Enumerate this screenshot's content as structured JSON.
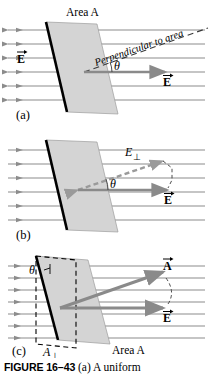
{
  "figure": {
    "number": "FIGURE 16–43",
    "caption_text": "(a) A uniform",
    "area_label_a": "Area A",
    "area_label_c": "Area A",
    "perpendicular_label": "Perpendicular to area"
  },
  "panels": [
    {
      "id": "a",
      "panel_label": "(a)",
      "labels": {
        "field_left": "E",
        "field_right": "E",
        "theta": "θ",
        "area": "Area A",
        "perpendicular": "Perpendicular to area"
      }
    },
    {
      "id": "b",
      "panel_label": "(b)",
      "labels": {
        "e_perp": "E",
        "e_perp_sub": "⊥",
        "theta": "θ",
        "field": "E"
      }
    },
    {
      "id": "c",
      "panel_label": "(c)",
      "labels": {
        "area_vector": "A",
        "field": "E",
        "theta": "θ",
        "a_perp": "A",
        "a_perp_sub": "⊥",
        "area": "Area A"
      }
    }
  ],
  "colors": {
    "field_line": "#8c8c8c",
    "surface_fill": "#d4d4d4",
    "surface_edge": "#000000",
    "vector_gray": "#8a8a8a",
    "dashed_gray": "#9a9a9a",
    "text": "#000000"
  }
}
